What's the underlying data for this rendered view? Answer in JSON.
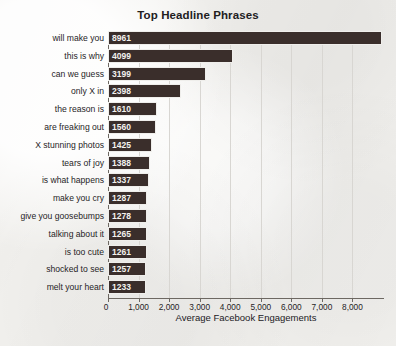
{
  "chart_data": {
    "type": "bar",
    "orientation": "horizontal",
    "title": "Top Headline Phrases",
    "xlabel": "Average Facebook Engagements",
    "ylabel": "",
    "xlim": [
      0,
      9000
    ],
    "xticks": [
      "0",
      "1,000",
      "2,000",
      "3,000",
      "4,000",
      "5,000",
      "6,000",
      "7,000",
      "8,000"
    ],
    "xtick_values": [
      0,
      1000,
      2000,
      3000,
      4000,
      5000,
      6000,
      7000,
      8000
    ],
    "grid": "vertical",
    "legend": "none",
    "bar_color": "#3a2e2b",
    "categories": [
      "will make you",
      "this is why",
      "can we guess",
      "only X in",
      "the reason is",
      "are freaking out",
      "X stunning photos",
      "tears of joy",
      "is what happens",
      "make you cry",
      "give you goosebumps",
      "talking about it",
      "is too cute",
      "shocked to see",
      "melt your heart"
    ],
    "values": [
      8961,
      4099,
      3199,
      2398,
      1610,
      1560,
      1425,
      1388,
      1337,
      1287,
      1278,
      1265,
      1261,
      1257,
      1233
    ],
    "value_labels": [
      "8961",
      "4099",
      "3199",
      "2398",
      "1610",
      "1560",
      "1425",
      "1388",
      "1337",
      "1287",
      "1278",
      "1265",
      "1261",
      "1257",
      "1233"
    ]
  }
}
